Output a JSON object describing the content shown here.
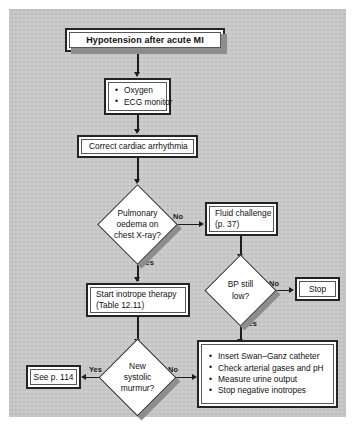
{
  "figure": {
    "type": "clinical-flowchart",
    "subject": "Hypotension after acute MI",
    "background_color": "#c9c9c9",
    "node_fill": "#ffffff",
    "line_color": "#1d1d1d",
    "shadow_color": "#8d8d8d"
  },
  "nodes": {
    "title": {
      "shape": "banner",
      "label": "Hypotension after acute MI"
    },
    "initial_measures": {
      "shape": "process",
      "bullets": [
        "Oxygen",
        "ECG monitor"
      ]
    },
    "correct_arrhythmia": {
      "shape": "process",
      "label": "Correct cardiac arrhythmia"
    },
    "pulmonary_oedema": {
      "shape": "decision",
      "lines": [
        "Pulmonary",
        "oedema on",
        "chest X-ray?"
      ]
    },
    "fluid_challenge": {
      "shape": "process",
      "lines": [
        "Fluid challenge",
        "(p. 37)"
      ]
    },
    "bp_still_low": {
      "shape": "decision",
      "lines": [
        "BP still",
        "low?"
      ]
    },
    "stop": {
      "shape": "process",
      "label": "Stop"
    },
    "start_inotrope": {
      "shape": "process",
      "lines": [
        "Start inotrope therapy",
        "(Table 12.11)"
      ]
    },
    "new_systolic_murmur": {
      "shape": "decision",
      "lines": [
        "New",
        "systolic",
        "murmur?"
      ]
    },
    "see_page": {
      "shape": "process",
      "label": "See p. 114"
    },
    "monitoring_measures": {
      "shape": "process",
      "bullets": [
        "Insert Swan–Ganz catheter",
        "Check arterial gases and pH",
        "Measure urine output",
        "Stop negative inotropes"
      ]
    }
  },
  "edge_labels": {
    "oedema_no": "No",
    "oedema_yes": "Yes",
    "bp_no": "No",
    "bp_yes": "Yes",
    "murmur_yes": "Yes",
    "murmur_no": "No"
  }
}
